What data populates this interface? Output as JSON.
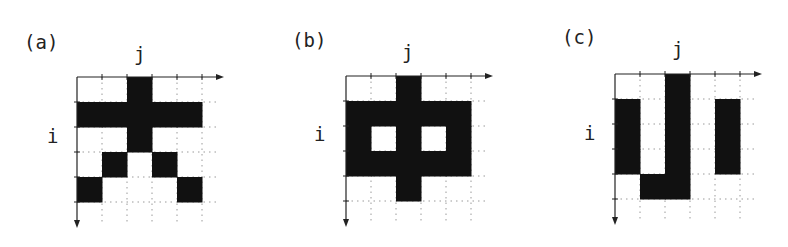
{
  "figure": {
    "panels": [
      {
        "label": "(a)",
        "x_axis_label": "j",
        "y_axis_label": "i",
        "rows": 5,
        "cols": 5,
        "filled_cells": [
          [
            0,
            2
          ],
          [
            1,
            0
          ],
          [
            1,
            1
          ],
          [
            1,
            2
          ],
          [
            1,
            3
          ],
          [
            1,
            4
          ],
          [
            2,
            2
          ],
          [
            3,
            1
          ],
          [
            3,
            3
          ],
          [
            4,
            0
          ],
          [
            4,
            4
          ]
        ]
      },
      {
        "label": "(b)",
        "x_axis_label": "j",
        "y_axis_label": "i",
        "rows": 5,
        "cols": 5,
        "filled_cells": [
          [
            0,
            2
          ],
          [
            1,
            0
          ],
          [
            1,
            1
          ],
          [
            1,
            2
          ],
          [
            1,
            3
          ],
          [
            1,
            4
          ],
          [
            2,
            0
          ],
          [
            2,
            2
          ],
          [
            2,
            4
          ],
          [
            3,
            0
          ],
          [
            3,
            1
          ],
          [
            3,
            2
          ],
          [
            3,
            3
          ],
          [
            3,
            4
          ],
          [
            4,
            2
          ]
        ]
      },
      {
        "label": "(c)",
        "x_axis_label": "j",
        "y_axis_label": "i",
        "rows": 5,
        "cols": 5,
        "filled_cells": [
          [
            0,
            2
          ],
          [
            1,
            0
          ],
          [
            1,
            2
          ],
          [
            1,
            4
          ],
          [
            2,
            0
          ],
          [
            2,
            2
          ],
          [
            2,
            4
          ],
          [
            3,
            0
          ],
          [
            3,
            2
          ],
          [
            3,
            4
          ],
          [
            4,
            1
          ],
          [
            4,
            2
          ]
        ]
      }
    ],
    "colors": {
      "fill": "#111111",
      "axis": "#222222",
      "grid_dots": "#9a9a9a",
      "background": "#ffffff"
    }
  }
}
